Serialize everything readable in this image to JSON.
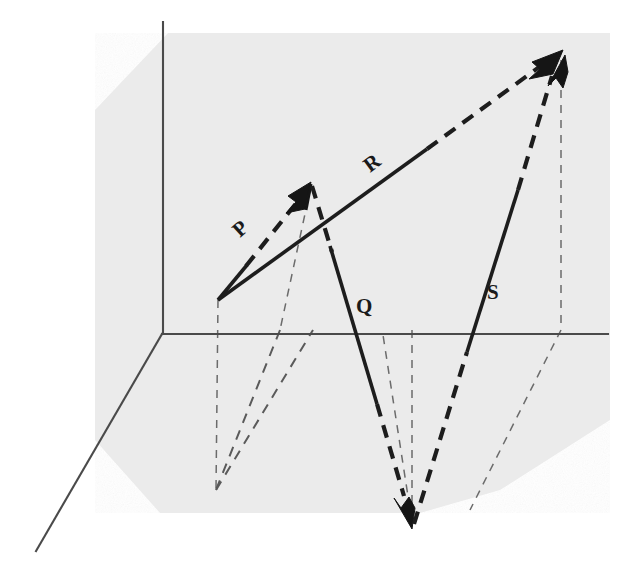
{
  "figure": {
    "background_color": "#ffffff",
    "plane_color": "#ebebeb",
    "ink_color": "#1d1d1d",
    "axis_color": "#4a4a4a"
  },
  "axes": {
    "origin": {
      "x": 162,
      "y": 334
    },
    "vertical": {
      "name": "y-axis",
      "x1": 163,
      "y1": 22,
      "x2": 163,
      "y2": 334
    },
    "horizontal": {
      "name": "x-axis",
      "x1": 162,
      "y1": 334,
      "x2": 608,
      "y2": 334
    },
    "depth": {
      "name": "z-axis",
      "x1": 162,
      "y1": 334,
      "x2": 36,
      "y2": 551
    }
  },
  "plane": {
    "name": "shaded-plane",
    "points": "95,110 168,33 610,33 610,420 500,490 420,513 300,513 160,513 95,440"
  },
  "vectors": [
    {
      "id": "P",
      "label": "P",
      "label_x": 240,
      "label_y": 238,
      "label_rotation": -42,
      "tail": {
        "x": 218,
        "y": 300
      },
      "tip": {
        "x": 311,
        "y": 184
      },
      "style": "dashed",
      "arrow": "tip"
    },
    {
      "id": "Q",
      "label": "Q",
      "label_x": 356,
      "label_y": 313,
      "label_rotation": 0,
      "tail": {
        "x": 311,
        "y": 184
      },
      "tip": {
        "x": 412,
        "y": 527
      },
      "style": "solid-then-dashed",
      "arrow": "tip"
    },
    {
      "id": "R",
      "label": "R",
      "label_x": 370,
      "label_y": 173,
      "label_rotation": -37,
      "tail": {
        "x": 218,
        "y": 300
      },
      "tip": {
        "x": 561,
        "y": 53
      },
      "style": "solid-then-dashed",
      "arrow": "tip"
    },
    {
      "id": "S",
      "label": "S",
      "label_x": 487,
      "label_y": 299,
      "label_rotation": 0,
      "tail": {
        "x": 412,
        "y": 527
      },
      "tip": {
        "x": 563,
        "y": 56
      },
      "style": "dashed-solid-dashed",
      "arrow": "tip"
    }
  ],
  "projections": [
    {
      "name": "origin-drop",
      "path": "M 218,300 L 216,490"
    },
    {
      "name": "origin-base-diagonal",
      "path": "M 216,490 L 313,330"
    },
    {
      "name": "p-tip-drop",
      "path": "M 311,186 L 280,330"
    },
    {
      "name": "p-tip-base-diagonal",
      "path": "M 280,330 L 216,490"
    },
    {
      "name": "q-tip-drop",
      "path": "M 412,330 L 412,522"
    },
    {
      "name": "q-tip-base-diagonal",
      "path": "M 412,522 L 383,335"
    },
    {
      "name": "r-tip-drop",
      "path": "M 561,60 L 561,330"
    },
    {
      "name": "r-tip-base-diagonal",
      "path": "M 561,330 L 470,510"
    }
  ]
}
